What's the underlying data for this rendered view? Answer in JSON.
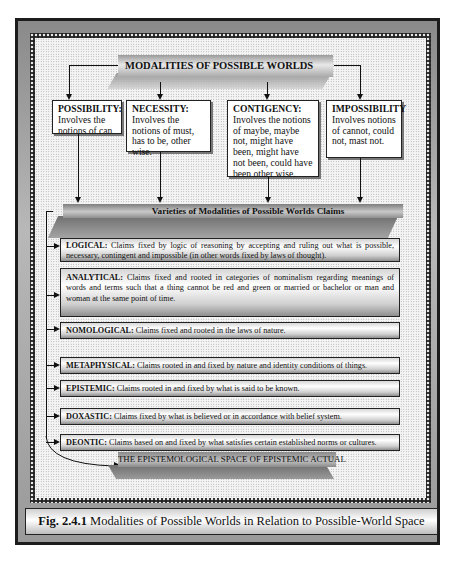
{
  "figure": {
    "title": "MODALITIES OF POSSIBLE WORLDS",
    "modalities": [
      {
        "heading": "POSSIBILITY:",
        "text": "Involves the notions of can"
      },
      {
        "heading": "NECESSITY:",
        "text": "Involves the notions of must, has to be, other wise."
      },
      {
        "heading": "CONTIGENCY:",
        "text": "Involves the notions of maybe, maybe not, might have been, might have not been, could have been other wise."
      },
      {
        "heading": "IMPOSSIBILITY",
        "text": "Involves notions of cannot, could not, mast not."
      }
    ],
    "varieties_title": "Varieties of Modalities of Possible Worlds Claims",
    "claims": [
      {
        "heading": "LOGICAL:",
        "text": "Claims fixed by logic of reasoning by accepting and ruling out what is possible, necessary, contingent and impossible (in other words fixed by laws of thought)."
      },
      {
        "heading": "ANALYTICAL:",
        "text": "Claims fixed and rooted in categories of nominalism regarding meanings of words and terms such that a thing cannot be red and green or married or bachelor or man and woman at the same point of time."
      },
      {
        "heading": "NOMOLOGICAL:",
        "text": "Claims fixed and rooted in the laws of nature."
      },
      {
        "heading": "METAPHYSICAL:",
        "text": "Claims rooted in and fixed by nature and identity conditions of things."
      },
      {
        "heading": "EPISTEMIC:",
        "text": "Claims rooted in and fixed by what is said to be known."
      },
      {
        "heading": "DOXASTIC:",
        "text": "Claims fixed by what is believed or in accordance with belief system."
      },
      {
        "heading": "DEONTIC:",
        "text": "Claims based on and fixed by what satisfies certain established norms or cultures."
      }
    ],
    "final_label": "THE EPISTEMOLOGICAL SPACE OF EPISTEMIC ACTUAL",
    "caption": {
      "label": "Fig. 2.4.1",
      "text": " Modalities of Possible Worlds in Relation to Possible-World Space"
    }
  }
}
